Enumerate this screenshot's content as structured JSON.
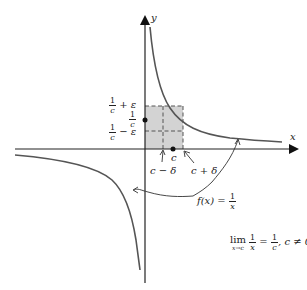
{
  "figure": {
    "type": "epsilon-delta limit illustration",
    "colors": {
      "axis": "#222222",
      "curve": "#555555",
      "shade": "#d3d3d3",
      "dashed": "#555555"
    },
    "axes": {
      "x_label": "x",
      "y_label": "y"
    },
    "y_labels": {
      "upper": {
        "num": "1",
        "den": "c",
        "suffix": "+ ε"
      },
      "center": {
        "num": "1",
        "den": "c"
      },
      "lower": {
        "num": "1",
        "den": "c",
        "suffix": "− ε"
      }
    },
    "x_labels": {
      "c": "c",
      "c_minus_delta": "c − δ",
      "c_plus_delta": "c + δ"
    },
    "function_label": {
      "prefix": "f(x) =",
      "num": "1",
      "den": "x"
    },
    "limit_statement": {
      "lim": "lim",
      "sub": "x→c",
      "num1": "1",
      "den1": "x",
      "equals": "=",
      "num2": "1",
      "den2": "c",
      "condition": ", c ≠ 0"
    }
  }
}
